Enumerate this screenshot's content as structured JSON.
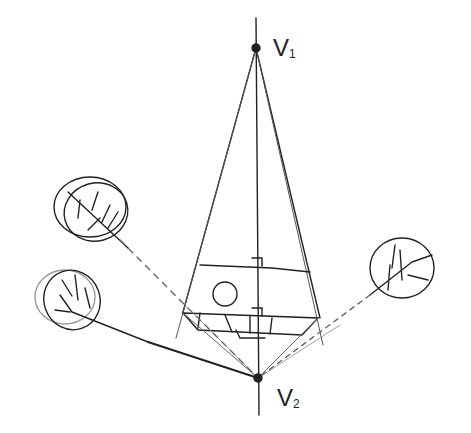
{
  "diagram": {
    "type": "two-point vertical perspective sketch",
    "vanishing_points": [
      {
        "id": "V1",
        "label": "V",
        "subscript": "1",
        "x": 256,
        "y": 48
      },
      {
        "id": "V2",
        "label": "V",
        "subscript": "2",
        "x": 258,
        "y": 378
      }
    ],
    "objects": [
      "building block with round window",
      "tree canopy upper-left",
      "tree canopy lower-left",
      "tree canopy right"
    ],
    "colors": {
      "ink": "#222222",
      "light_ink": "#888888",
      "background": "#ffffff"
    }
  }
}
